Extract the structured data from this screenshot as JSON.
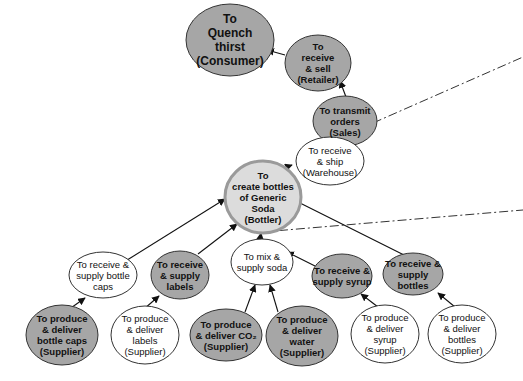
{
  "diagram": {
    "colors": {
      "shaded_fill": "#a6a6a6",
      "plain_fill": "#ffffff",
      "stroke": "#333333",
      "focus_ring": "#9a9a9a",
      "focus_fill": "#dcdcdc"
    },
    "nodes": [
      {
        "id": "consumer",
        "label": "To\nQuench\nthirst\n(Consumer)",
        "style": "shaded"
      },
      {
        "id": "retailer",
        "label": "To\nreceive\n& sell\n(Retailer)",
        "style": "shaded"
      },
      {
        "id": "sales",
        "label": "To transmit\norders\n(Sales)",
        "style": "shaded"
      },
      {
        "id": "warehouse",
        "label": "To receive\n& ship\n(Warehouse)",
        "style": "plain"
      },
      {
        "id": "bottler",
        "label": "To\ncreate bottles\nof Generic\nSoda\n(Bottler)",
        "style": "focus"
      },
      {
        "id": "caps",
        "label": "To receive &\nsupply bottle\ncaps",
        "style": "plain"
      },
      {
        "id": "labels",
        "label": "To receive\n& supply\nlabels",
        "style": "shaded"
      },
      {
        "id": "mix",
        "label": "To mix &\nsupply soda",
        "style": "plain"
      },
      {
        "id": "syrup",
        "label": "To receive &\nsupply syrup",
        "style": "shaded"
      },
      {
        "id": "bottles",
        "label": "To receive &\nsupply bottles",
        "style": "shaded"
      },
      {
        "id": "sup_caps",
        "label": "To produce\n& deliver\nbottle caps\n(Supplier)",
        "style": "shaded"
      },
      {
        "id": "sup_labels",
        "label": "To produce\n& deliver\nlabels\n(Supplier)",
        "style": "plain"
      },
      {
        "id": "sup_co2",
        "label": "To produce\n& deliver CO₂\n(Supplier)",
        "style": "shaded"
      },
      {
        "id": "sup_water",
        "label": "To produce\n& deliver\nwater\n(Supplier)",
        "style": "shaded"
      },
      {
        "id": "sup_syrup",
        "label": "To produce\n& deliver\nsyrup\n(Supplier)",
        "style": "plain"
      },
      {
        "id": "sup_bottles",
        "label": "To produce\n& deliver\nbottles\n(Supplier)",
        "style": "plain"
      }
    ],
    "edges": [
      {
        "from": "retailer",
        "to": "consumer"
      },
      {
        "from": "sales",
        "to": "retailer"
      },
      {
        "from": "warehouse",
        "to": "sales"
      },
      {
        "from": "bottler",
        "to": "warehouse"
      },
      {
        "from": "caps",
        "to": "bottler"
      },
      {
        "from": "labels",
        "to": "bottler"
      },
      {
        "from": "mix",
        "to": "bottler"
      },
      {
        "from": "bottles",
        "to": "bottler"
      },
      {
        "from": "syrup",
        "to": "mix"
      },
      {
        "from": "sup_caps",
        "to": "caps"
      },
      {
        "from": "sup_labels",
        "to": "labels"
      },
      {
        "from": "sup_co2",
        "to": "mix"
      },
      {
        "from": "sup_water",
        "to": "mix"
      },
      {
        "from": "sup_syrup",
        "to": "syrup"
      },
      {
        "from": "sup_bottles",
        "to": "bottles"
      }
    ],
    "boundary_lines": [
      {
        "style": "dash-dot",
        "description": "from Sales node toward upper right"
      },
      {
        "style": "dash-dot",
        "description": "from Bottler node toward right edge"
      }
    ]
  }
}
